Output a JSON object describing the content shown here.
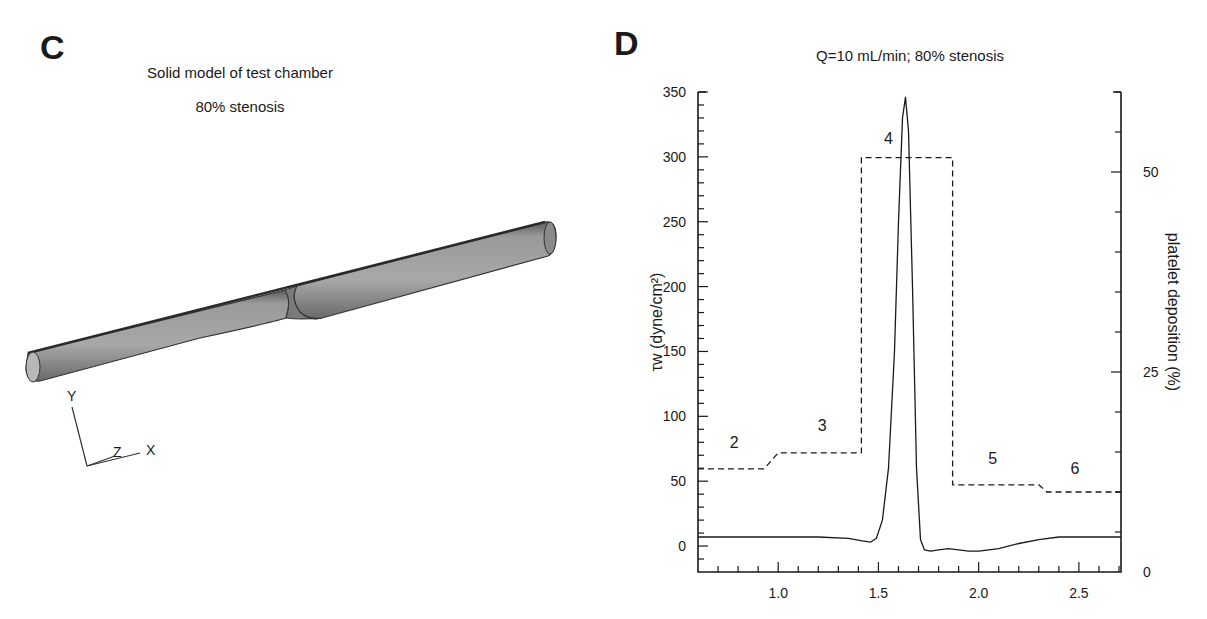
{
  "panel_c": {
    "letter": "C",
    "title_line1": "Solid model of test chamber",
    "title_line2": "80% stenosis",
    "axes_triad": {
      "y": "Y",
      "z": "Z",
      "x": "X"
    }
  },
  "panel_d": {
    "letter": "D",
    "title": "Q=10 mL/min; 80% stenosis"
  },
  "chart_data": [
    {
      "type": "line",
      "title": "Q=10 mL/min; 80% stenosis",
      "xlabel": "",
      "ylabel": "τw (dyne/cm²)",
      "y2label": "platelet deposition (%)",
      "xlim": [
        0.6,
        2.71
      ],
      "ylim": [
        -20,
        350
      ],
      "y2lim": [
        0,
        60
      ],
      "xticks": [
        1.0,
        1.5,
        2.0,
        2.5
      ],
      "xtick_labels": [
        "1.0",
        "1.5",
        "2.0",
        "2.5"
      ],
      "yticks": [
        0,
        50,
        100,
        150,
        200,
        250,
        300,
        350
      ],
      "ytick_labels": [
        "0",
        "50",
        "100",
        "150",
        "200",
        "250",
        "300",
        "350"
      ],
      "y2ticks": [
        0,
        25,
        50
      ],
      "y2tick_labels": [
        "0",
        "25",
        "50"
      ],
      "grid": false,
      "series": [
        {
          "name": "wall shear stress τw",
          "axis": "left",
          "style": "solid",
          "x": [
            0.6,
            0.8,
            1.0,
            1.2,
            1.35,
            1.42,
            1.46,
            1.49,
            1.52,
            1.55,
            1.58,
            1.6,
            1.62,
            1.635,
            1.65,
            1.67,
            1.69,
            1.71,
            1.73,
            1.76,
            1.8,
            1.85,
            1.9,
            1.95,
            2.0,
            2.1,
            2.2,
            2.3,
            2.4,
            2.5,
            2.6,
            2.71
          ],
          "y": [
            7,
            7,
            7,
            7,
            6,
            4,
            3,
            6,
            20,
            60,
            150,
            250,
            330,
            346,
            320,
            200,
            60,
            5,
            -3,
            -4,
            -3,
            -2,
            -3,
            -4,
            -4,
            -2,
            2,
            5,
            7,
            7,
            7,
            7
          ]
        },
        {
          "name": "platelet deposition",
          "axis": "right",
          "style": "dashed",
          "x": [
            0.6,
            0.93,
            1.0,
            1.415,
            1.415,
            1.87,
            1.87,
            2.3,
            2.34,
            2.71
          ],
          "y": [
            12.9,
            12.9,
            14.9,
            14.9,
            51.8,
            51.8,
            10.9,
            10.9,
            10.0,
            10.0
          ]
        }
      ],
      "annotations": [
        {
          "text": "2",
          "x": 0.78,
          "y2": 15.5
        },
        {
          "text": "3",
          "x": 1.22,
          "y2": 17.6
        },
        {
          "text": "4",
          "x": 1.55,
          "y2": 53.5
        },
        {
          "text": "5",
          "x": 2.07,
          "y2": 13.5
        },
        {
          "text": "6",
          "x": 2.48,
          "y2": 12.2
        }
      ]
    }
  ]
}
